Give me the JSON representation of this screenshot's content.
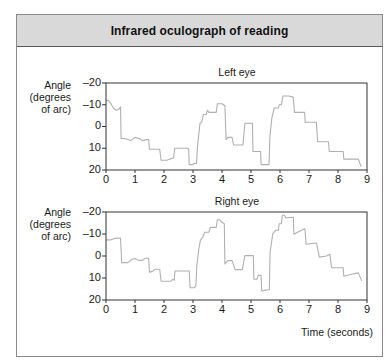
{
  "header": {
    "title": "Infrared oculograph of reading"
  },
  "colors": {
    "trace": "#b0b0b0",
    "axis": "#333333",
    "header_bg": "#d9d9d9"
  },
  "chart_data": [
    {
      "type": "line",
      "title": "Left eye",
      "ylabel_lines": [
        "Angle",
        "(degrees",
        "of arc)"
      ],
      "xlabel": "",
      "xlim": [
        0,
        9
      ],
      "ylim": [
        -20,
        20
      ],
      "y_inverted": true,
      "grid": false,
      "xticks": [
        0,
        1,
        2,
        3,
        4,
        5,
        6,
        7,
        8,
        9
      ],
      "xtick_labels": [
        "0",
        "1",
        "2",
        "3",
        "4",
        "5",
        "6",
        "7",
        "8",
        "9"
      ],
      "yticks": [
        -20,
        -10,
        0,
        10,
        20
      ],
      "ytick_labels": [
        "–20",
        "–10",
        "0",
        "10",
        "20"
      ],
      "series": [
        {
          "name": "Left eye",
          "points": [
            [
              0,
              -12
            ],
            [
              0.08,
              -12
            ],
            [
              0.15,
              -11
            ],
            [
              0.25,
              -8.5
            ],
            [
              0.35,
              -7.5
            ],
            [
              0.45,
              -8
            ],
            [
              0.5,
              -9
            ],
            [
              0.52,
              5.5
            ],
            [
              0.65,
              5.5
            ],
            [
              0.75,
              6
            ],
            [
              0.85,
              6.5
            ],
            [
              1.0,
              5
            ],
            [
              1.15,
              5.5
            ],
            [
              1.25,
              6.5
            ],
            [
              1.4,
              6
            ],
            [
              1.47,
              6
            ],
            [
              1.5,
              10.5
            ],
            [
              1.85,
              10.5
            ],
            [
              1.9,
              15.5
            ],
            [
              2.1,
              15.5
            ],
            [
              2.2,
              15
            ],
            [
              2.33,
              14.5
            ],
            [
              2.37,
              10
            ],
            [
              2.85,
              10
            ],
            [
              2.87,
              17.5
            ],
            [
              3.0,
              17.5
            ],
            [
              3.02,
              17
            ],
            [
              3.12,
              17
            ],
            [
              3.15,
              10.5
            ],
            [
              3.18,
              6
            ],
            [
              3.24,
              -1.5
            ],
            [
              3.3,
              -2
            ],
            [
              3.36,
              -5.5
            ],
            [
              3.45,
              -5.5
            ],
            [
              3.5,
              -7.5
            ],
            [
              3.55,
              -6.5
            ],
            [
              3.8,
              -6.5
            ],
            [
              3.84,
              -10.5
            ],
            [
              4.0,
              -10.5
            ],
            [
              4.1,
              -9.5
            ],
            [
              4.14,
              6
            ],
            [
              4.2,
              5
            ],
            [
              4.35,
              5
            ],
            [
              4.4,
              8.5
            ],
            [
              4.72,
              8.5
            ],
            [
              4.79,
              -1.5
            ],
            [
              5.05,
              -1.5
            ],
            [
              5.07,
              11.5
            ],
            [
              5.33,
              11.5
            ],
            [
              5.35,
              17.5
            ],
            [
              5.62,
              17.5
            ],
            [
              5.65,
              4.5
            ],
            [
              5.72,
              -4
            ],
            [
              5.8,
              -8.5
            ],
            [
              5.95,
              -8.5
            ],
            [
              5.97,
              -10
            ],
            [
              6.05,
              -10
            ],
            [
              6.1,
              -14
            ],
            [
              6.3,
              -14
            ],
            [
              6.45,
              -13.5
            ],
            [
              6.5,
              -6.5
            ],
            [
              6.85,
              -6.5
            ],
            [
              6.87,
              -2
            ],
            [
              7.25,
              -2
            ],
            [
              7.3,
              7
            ],
            [
              7.67,
              7
            ],
            [
              7.7,
              11.5
            ],
            [
              8.18,
              11.5
            ],
            [
              8.2,
              15
            ],
            [
              8.7,
              15
            ],
            [
              8.8,
              18.5
            ]
          ]
        }
      ]
    },
    {
      "type": "line",
      "title": "Right eye",
      "ylabel_lines": [
        "Angle",
        "(degrees",
        "of arc)"
      ],
      "xlabel": "Time (seconds)",
      "xlim": [
        0,
        9
      ],
      "ylim": [
        -20,
        20
      ],
      "y_inverted": true,
      "grid": false,
      "xticks": [
        0,
        1,
        2,
        3,
        4,
        5,
        6,
        7,
        8,
        9
      ],
      "xtick_labels": [
        "0",
        "1",
        "2",
        "3",
        "4",
        "5",
        "6",
        "7",
        "8",
        "9"
      ],
      "yticks": [
        -20,
        -10,
        0,
        10,
        20
      ],
      "ytick_labels": [
        "–20",
        "–10",
        "0",
        "10",
        "20"
      ],
      "series": [
        {
          "name": "Right eye",
          "points": [
            [
              0,
              -7.3
            ],
            [
              0.15,
              -7.3
            ],
            [
              0.3,
              -8
            ],
            [
              0.5,
              -8.2
            ],
            [
              0.54,
              3
            ],
            [
              0.75,
              3
            ],
            [
              0.9,
              1.5
            ],
            [
              1.0,
              1.2
            ],
            [
              1.15,
              2
            ],
            [
              1.25,
              2
            ],
            [
              1.35,
              1
            ],
            [
              1.47,
              1
            ],
            [
              1.5,
              7.3
            ],
            [
              1.6,
              7
            ],
            [
              1.7,
              6
            ],
            [
              1.85,
              6
            ],
            [
              1.9,
              11.5
            ],
            [
              2.23,
              11.5
            ],
            [
              2.3,
              10.6
            ],
            [
              2.35,
              11
            ],
            [
              2.38,
              6.8
            ],
            [
              2.87,
              6.8
            ],
            [
              2.9,
              14.4
            ],
            [
              3.05,
              14.4
            ],
            [
              3.1,
              13.5
            ],
            [
              3.13,
              4.4
            ],
            [
              3.2,
              -3.2
            ],
            [
              3.25,
              -7
            ],
            [
              3.35,
              -9
            ],
            [
              3.4,
              -10.8
            ],
            [
              3.55,
              -10.8
            ],
            [
              3.6,
              -13
            ],
            [
              3.8,
              -13
            ],
            [
              3.84,
              -16.5
            ],
            [
              3.92,
              -16.5
            ],
            [
              4.0,
              -15.3
            ],
            [
              4.08,
              -14.7
            ],
            [
              4.1,
              3.6
            ],
            [
              4.2,
              2.1
            ],
            [
              4.35,
              2.1
            ],
            [
              4.45,
              6.2
            ],
            [
              4.7,
              6.2
            ],
            [
              4.79,
              -0.2
            ],
            [
              5.08,
              -0.2
            ],
            [
              5.1,
              10.6
            ],
            [
              5.2,
              10.6
            ],
            [
              5.25,
              8.8
            ],
            [
              5.35,
              8.8
            ],
            [
              5.37,
              15.9
            ],
            [
              5.5,
              15.5
            ],
            [
              5.63,
              15.3
            ],
            [
              5.66,
              -1.8
            ],
            [
              5.75,
              -10.2
            ],
            [
              5.85,
              -11.7
            ],
            [
              5.95,
              -11.7
            ],
            [
              5.97,
              -14.7
            ],
            [
              6.05,
              -14.7
            ],
            [
              6.08,
              -18.5
            ],
            [
              6.15,
              -18.5
            ],
            [
              6.2,
              -17.4
            ],
            [
              6.46,
              -17.6
            ],
            [
              6.48,
              -9.9
            ],
            [
              6.7,
              -11.5
            ],
            [
              6.86,
              -12.4
            ],
            [
              6.9,
              -5.3
            ],
            [
              7.26,
              -5.9
            ],
            [
              7.36,
              0.5
            ],
            [
              7.6,
              0
            ],
            [
              7.72,
              -0.8
            ],
            [
              7.78,
              5.3
            ],
            [
              8.18,
              5.3
            ],
            [
              8.2,
              9.2
            ],
            [
              8.5,
              8.2
            ],
            [
              8.7,
              7.7
            ],
            [
              8.82,
              11.3
            ]
          ]
        }
      ]
    }
  ]
}
